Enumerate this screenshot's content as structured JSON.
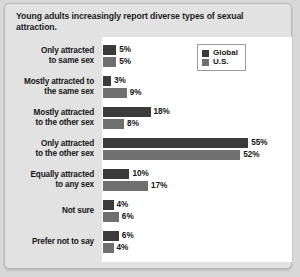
{
  "title": "Young adults increasingly report diverse types of sexual attraction.",
  "legend": {
    "items": [
      {
        "label": "Global",
        "color": "#3b3b3b"
      },
      {
        "label": "U.S.",
        "color": "#6f6f6f"
      }
    ]
  },
  "chart_data": {
    "type": "bar",
    "orientation": "horizontal",
    "title": "Young adults increasingly report diverse types of sexual attraction.",
    "xlabel": "",
    "ylabel": "",
    "xlim": [
      0,
      60
    ],
    "grid": false,
    "legend_position": "top-right",
    "value_suffix": "%",
    "categories": [
      "Only attracted to same sex",
      "Mostly attracted to the same sex",
      "Mostly attracted to the other sex",
      "Only attracted to the other sex",
      "Equally attracted to any sex",
      "Not sure",
      "Prefer not to say"
    ],
    "category_lines": [
      [
        "Only attracted",
        "to same sex"
      ],
      [
        "Mostly attracted to",
        "the same sex"
      ],
      [
        "Mostly attracted",
        "to the other sex"
      ],
      [
        "Only attracted",
        "to the other sex"
      ],
      [
        "Equally attracted",
        "to any sex"
      ],
      [
        "Not sure"
      ],
      [
        "Prefer not to say"
      ]
    ],
    "series": [
      {
        "name": "Global",
        "color": "#3b3b3b",
        "values": [
          5,
          3,
          18,
          55,
          10,
          4,
          6
        ],
        "labels": [
          "5%",
          "3%",
          "18%",
          "55%",
          "10%",
          "4%",
          "6%"
        ]
      },
      {
        "name": "U.S.",
        "color": "#6f6f6f",
        "values": [
          5,
          9,
          8,
          52,
          17,
          6,
          4
        ],
        "labels": [
          "5%",
          "9%",
          "8%",
          "52%",
          "17%",
          "6%",
          "4%"
        ]
      }
    ]
  },
  "colors": {
    "page_background": "#d8d8d8",
    "frame_background": "#e2e2e2",
    "panel_background": "#ffffff",
    "text": "#161616"
  }
}
